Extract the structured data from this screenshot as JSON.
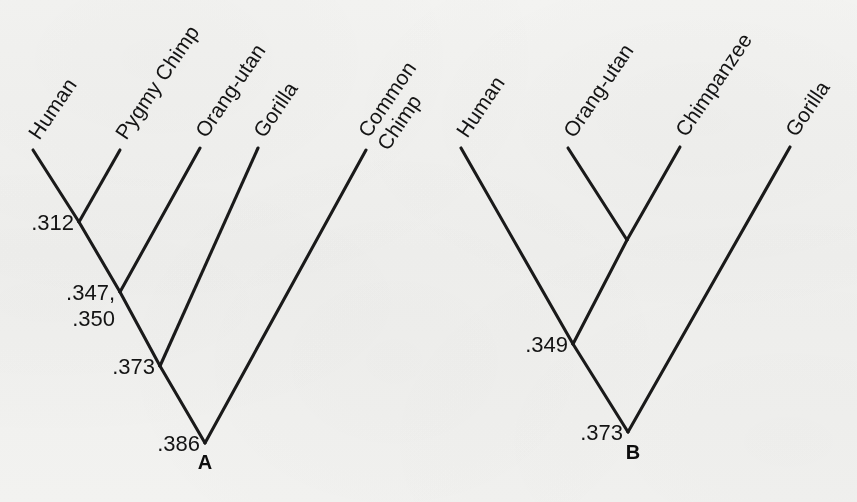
{
  "figure": {
    "kind": "phylogenetic-tree-figure",
    "background_color": "#f8f8f7",
    "line_color": "#1a1a1a",
    "text_color": "#141414"
  },
  "panels": [
    {
      "id": "A",
      "letter": "A",
      "letter_pos": {
        "x": 205,
        "y": 469
      },
      "tips": [
        {
          "name": "human",
          "label": "Human",
          "x": 33,
          "y": 150,
          "label_x": 36,
          "label_y": 146,
          "angle": -56,
          "lines": [
            "Human"
          ]
        },
        {
          "name": "pygmy-chimp",
          "label": "Pygmy Chimp",
          "x": 120,
          "y": 150,
          "label_x": 123,
          "label_y": 146,
          "angle": -56,
          "lines": [
            "Pygmy Chimp"
          ]
        },
        {
          "name": "orang-utan",
          "label": "Orang-utan",
          "x": 200,
          "y": 148,
          "label_x": 203,
          "label_y": 144,
          "angle": -56,
          "lines": [
            "Orang-utan"
          ]
        },
        {
          "name": "gorilla",
          "label": "Gorilla",
          "x": 258,
          "y": 148,
          "label_x": 261,
          "label_y": 144,
          "angle": -56,
          "lines": [
            "Gorilla"
          ]
        },
        {
          "name": "common-chimp",
          "label": "Common Chimp",
          "x": 366,
          "y": 150,
          "label_x": 369,
          "label_y": 146,
          "angle": -56,
          "lines": [
            "Common",
            "Chimp"
          ]
        }
      ],
      "nodes": [
        {
          "name": "human-pygmy-chimp-node",
          "x": 79,
          "y": 222,
          "values": [
            ".312"
          ],
          "label_x": 74,
          "label_y": 230
        },
        {
          "name": "hominine-node",
          "x": 120,
          "y": 292,
          "values": [
            ".347,",
            ".350"
          ],
          "label_x": 115,
          "label_y": 300
        },
        {
          "name": "great-ape-node",
          "x": 160,
          "y": 366,
          "values": [
            ".373"
          ],
          "label_x": 155,
          "label_y": 374
        },
        {
          "name": "root-node",
          "x": 205,
          "y": 443,
          "values": [
            ".386"
          ],
          "label_x": 200,
          "label_y": 451
        }
      ],
      "edges": [
        {
          "name": "edge-human",
          "from": {
            "x": 33,
            "y": 150
          },
          "to": {
            "x": 79,
            "y": 222
          }
        },
        {
          "name": "edge-pygmy-chimp",
          "from": {
            "x": 120,
            "y": 150
          },
          "to": {
            "x": 79,
            "y": 222
          }
        },
        {
          "name": "edge-312-to-347",
          "from": {
            "x": 79,
            "y": 222
          },
          "to": {
            "x": 120,
            "y": 292
          }
        },
        {
          "name": "edge-orang-utan",
          "from": {
            "x": 200,
            "y": 148
          },
          "to": {
            "x": 120,
            "y": 292
          }
        },
        {
          "name": "edge-347-to-373",
          "from": {
            "x": 120,
            "y": 292
          },
          "to": {
            "x": 160,
            "y": 366
          }
        },
        {
          "name": "edge-gorilla",
          "from": {
            "x": 258,
            "y": 148
          },
          "to": {
            "x": 160,
            "y": 366
          }
        },
        {
          "name": "edge-373-to-root",
          "from": {
            "x": 160,
            "y": 366
          },
          "to": {
            "x": 205,
            "y": 443
          }
        },
        {
          "name": "edge-common-chimp",
          "from": {
            "x": 366,
            "y": 150
          },
          "to": {
            "x": 205,
            "y": 443
          }
        }
      ]
    },
    {
      "id": "B",
      "letter": "B",
      "letter_pos": {
        "x": 633,
        "y": 459
      },
      "tips": [
        {
          "name": "human",
          "label": "Human",
          "x": 461,
          "y": 148,
          "label_x": 464,
          "label_y": 144,
          "angle": -56,
          "lines": [
            "Human"
          ]
        },
        {
          "name": "orang-utan",
          "label": "Orang-utan",
          "x": 568,
          "y": 148,
          "label_x": 571,
          "label_y": 144,
          "angle": -56,
          "lines": [
            "Orang-utan"
          ]
        },
        {
          "name": "chimpanzee",
          "label": "Chimpanzee",
          "x": 680,
          "y": 147,
          "label_x": 683,
          "label_y": 143,
          "angle": -56,
          "lines": [
            "Chimpanzee"
          ]
        },
        {
          "name": "gorilla",
          "label": "Gorilla",
          "x": 790,
          "y": 147,
          "label_x": 793,
          "label_y": 143,
          "angle": -56,
          "lines": [
            "Gorilla"
          ]
        }
      ],
      "nodes": [
        {
          "name": "orang-chimp-node",
          "x": 627,
          "y": 240,
          "values": [],
          "label_x": 622,
          "label_y": 248
        },
        {
          "name": "hominoid-node",
          "x": 573,
          "y": 344,
          "values": [
            ".349"
          ],
          "label_x": 568,
          "label_y": 352
        },
        {
          "name": "root-node",
          "x": 628,
          "y": 432,
          "values": [
            ".373"
          ],
          "label_x": 623,
          "label_y": 440
        }
      ],
      "edges": [
        {
          "name": "edge-orang-utan",
          "from": {
            "x": 568,
            "y": 148
          },
          "to": {
            "x": 627,
            "y": 240
          }
        },
        {
          "name": "edge-chimpanzee",
          "from": {
            "x": 680,
            "y": 147
          },
          "to": {
            "x": 627,
            "y": 240
          }
        },
        {
          "name": "edge-orangchimp-349",
          "from": {
            "x": 627,
            "y": 240
          },
          "to": {
            "x": 573,
            "y": 344
          }
        },
        {
          "name": "edge-human",
          "from": {
            "x": 461,
            "y": 148
          },
          "to": {
            "x": 573,
            "y": 344
          }
        },
        {
          "name": "edge-349-to-root",
          "from": {
            "x": 573,
            "y": 344
          },
          "to": {
            "x": 628,
            "y": 432
          }
        },
        {
          "name": "edge-gorilla",
          "from": {
            "x": 790,
            "y": 147
          },
          "to": {
            "x": 628,
            "y": 432
          }
        }
      ]
    }
  ],
  "chart_data": {
    "type": "diagram",
    "title": "",
    "subtitle": "",
    "trees": [
      {
        "panel": "A",
        "taxa": [
          "Human",
          "Pygmy Chimp",
          "Orang-utan",
          "Gorilla",
          "Common Chimp"
        ],
        "topology": "((((Human,Pygmy Chimp).312,Orang-utan)'.347, .350',Gorilla).373,Common Chimp).386",
        "node_values": [
          {
            "clade": [
              "Human",
              "Pygmy Chimp"
            ],
            "values": [
              ".312"
            ]
          },
          {
            "clade": [
              "Human",
              "Pygmy Chimp",
              "Orang-utan"
            ],
            "values": [
              ".347",
              ".350"
            ]
          },
          {
            "clade": [
              "Human",
              "Pygmy Chimp",
              "Orang-utan",
              "Gorilla"
            ],
            "values": [
              ".373"
            ]
          },
          {
            "clade": [
              "Human",
              "Pygmy Chimp",
              "Orang-utan",
              "Gorilla",
              "Common Chimp"
            ],
            "values": [
              ".386"
            ]
          }
        ]
      },
      {
        "panel": "B",
        "taxa": [
          "Human",
          "Orang-utan",
          "Chimpanzee",
          "Gorilla"
        ],
        "topology": "((Human,(Orang-utan,Chimpanzee)).349,Gorilla).373",
        "node_values": [
          {
            "clade": [
              "Orang-utan",
              "Chimpanzee"
            ],
            "values": []
          },
          {
            "clade": [
              "Human",
              "Orang-utan",
              "Chimpanzee"
            ],
            "values": [
              ".349"
            ]
          },
          {
            "clade": [
              "Human",
              "Orang-utan",
              "Chimpanzee",
              "Gorilla"
            ],
            "values": [
              ".373"
            ]
          }
        ]
      }
    ]
  }
}
